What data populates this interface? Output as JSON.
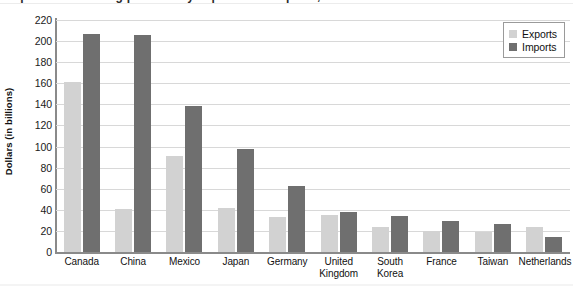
{
  "figure": {
    "title_clipped": "Top ten U.S. trading partners by exports and imports, in billions",
    "width": 573,
    "height": 286
  },
  "legend": {
    "position": "top-right",
    "entries": [
      {
        "label": "Exports",
        "color": "#d2d2d2",
        "swatch_name": "legend-swatch-exports"
      },
      {
        "label": "Imports",
        "color": "#6f6f6f",
        "swatch_name": "legend-swatch-imports"
      }
    ]
  },
  "axes": {
    "ylabel": "Dollars (in billions)",
    "xlabel": "",
    "yticks": [
      0,
      20,
      40,
      60,
      80,
      100,
      120,
      140,
      160,
      180,
      200,
      220
    ],
    "ylim": [
      0,
      220
    ],
    "grid": true
  },
  "chart_data": {
    "type": "bar",
    "title": "",
    "xlabel": "",
    "ylabel": "Dollars (in billions)",
    "ylim": [
      0,
      220
    ],
    "ytick_step": 20,
    "grid": true,
    "legend_position": "top-right",
    "categories": [
      "Canada",
      "China",
      "Mexico",
      "Japan",
      "Germany",
      "United Kingdom",
      "South Korea",
      "France",
      "Taiwan",
      "Netherlands"
    ],
    "series": [
      {
        "name": "Exports",
        "color": "#d2d2d2",
        "values": [
          161,
          41,
          91,
          42,
          33,
          35,
          24,
          20,
          19,
          24
        ]
      },
      {
        "name": "Imports",
        "color": "#6f6f6f",
        "values": [
          207,
          206,
          138,
          98,
          63,
          38,
          34,
          29,
          27,
          14
        ]
      }
    ]
  },
  "colors": {
    "exports": "#d2d2d2",
    "imports": "#6f6f6f",
    "gridline": "#d8d8d8",
    "axis": "#8a8a8a",
    "background": "#ffffff"
  }
}
